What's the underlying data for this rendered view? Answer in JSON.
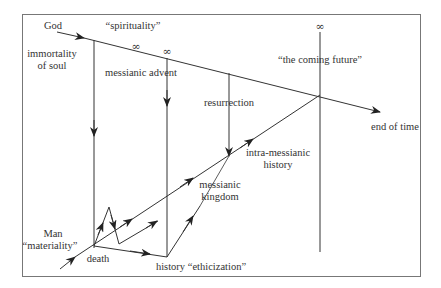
{
  "diagram": {
    "labels": {
      "god": "God",
      "spirituality": "“spirituality”",
      "immortality_line1": "immortality",
      "immortality_line2": "of soul",
      "messianic_advent": "messianic advent",
      "resurrection": "resurrection",
      "coming_future": "“the coming future”",
      "end_of_time": "end of time",
      "intra_line1": "intra-messianic",
      "intra_line2": "history",
      "kingdom_line1": "messianic",
      "kingdom_line2": "kingdom",
      "man": "Man",
      "materiality": "“materiality”",
      "death": "death",
      "ethicization": "history “ethicization”"
    },
    "infinity_symbol": "∞",
    "colors": {
      "line": "#333333",
      "frame": "#777777",
      "background": "#ffffff"
    }
  }
}
